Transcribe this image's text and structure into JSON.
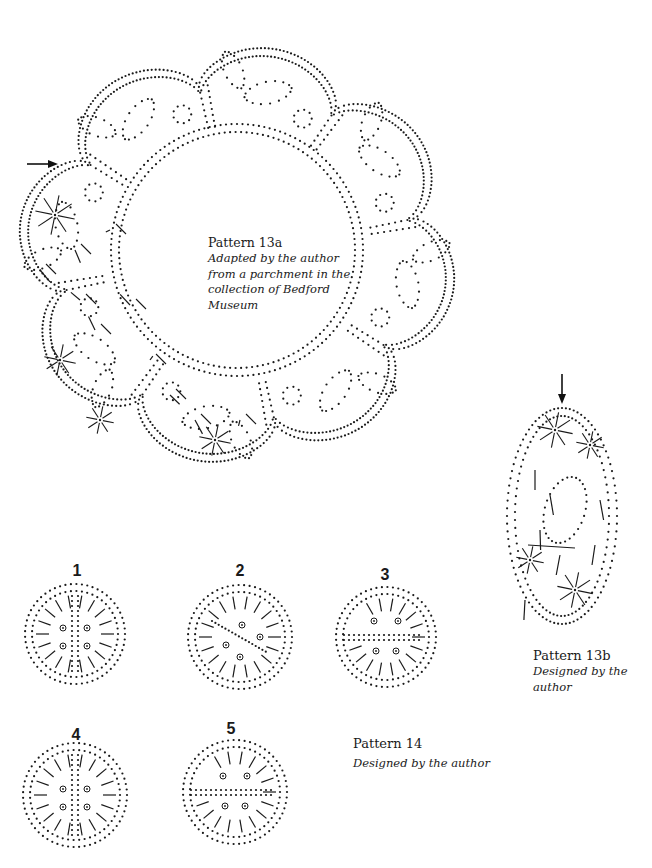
{
  "page": {
    "background": "#ffffff",
    "ink_color": "#1a1a1a"
  },
  "pattern_13a": {
    "title": "Pattern 13a",
    "caption_lines": [
      "Adapted by the author",
      "from a parchment in the",
      "collection of Bedford",
      "Museum"
    ],
    "description": "Circular dotted pricking with eight scalloped petal lobes, leaves and rings; left lobes worked with ground lines",
    "start_marker": "arrow-right"
  },
  "pattern_13b": {
    "title": "Pattern 13b",
    "caption": "Designed by the author",
    "description": "Oval dotted pricking with star and line ground",
    "start_marker": "arrow-down"
  },
  "pattern_14": {
    "title": "Pattern 14",
    "caption": "Designed by the author",
    "variants": [
      {
        "label": "1"
      },
      {
        "label": "2"
      },
      {
        "label": "3"
      },
      {
        "label": "4"
      },
      {
        "label": "5"
      }
    ]
  }
}
